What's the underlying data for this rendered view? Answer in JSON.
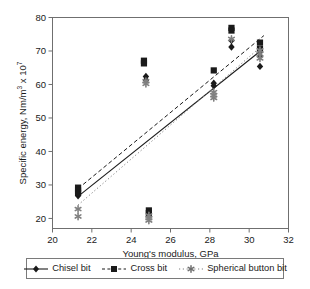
{
  "chart_data": {
    "type": "scatter",
    "title": "",
    "xlabel": "Young's modulus, GPa",
    "ylabel": "Specific energy, Nm/m",
    "ylabel_unit_base": "3",
    "ylabel_multiplier": " x 10",
    "ylabel_exponent": "7",
    "xlim": [
      20,
      32
    ],
    "ylim": [
      17,
      80
    ],
    "xticks": [
      20,
      22,
      24,
      26,
      28,
      30,
      32
    ],
    "yticks": [
      20,
      30,
      40,
      50,
      60,
      70,
      80
    ],
    "grid": false,
    "legend_position": "below-plot",
    "series": [
      {
        "name": "Chisel bit",
        "marker": "diamond",
        "color": "#1a1a1a",
        "line_style": "solid",
        "points": [
          {
            "x": 21.3,
            "y": 26.8
          },
          {
            "x": 21.3,
            "y": 27.4
          },
          {
            "x": 21.3,
            "y": 28.0
          },
          {
            "x": 24.75,
            "y": 62.4
          },
          {
            "x": 24.75,
            "y": 61.3
          },
          {
            "x": 28.2,
            "y": 60.4
          },
          {
            "x": 28.2,
            "y": 59.6
          },
          {
            "x": 29.1,
            "y": 73.1
          },
          {
            "x": 29.1,
            "y": 71.2
          },
          {
            "x": 30.55,
            "y": 69.8
          },
          {
            "x": 30.55,
            "y": 68.5
          },
          {
            "x": 30.55,
            "y": 65.4
          }
        ],
        "trend": {
          "x1": 21.3,
          "y1": 26.6,
          "x2": 30.7,
          "y2": 70.6
        }
      },
      {
        "name": "Cross bit",
        "marker": "square",
        "color": "#1a1a1a",
        "line_style": "dashed",
        "points": [
          {
            "x": 21.3,
            "y": 29.2
          },
          {
            "x": 21.3,
            "y": 28.4
          },
          {
            "x": 21.3,
            "y": 27.6
          },
          {
            "x": 24.65,
            "y": 67.1
          },
          {
            "x": 24.65,
            "y": 66.3
          },
          {
            "x": 24.9,
            "y": 22.4
          },
          {
            "x": 24.9,
            "y": 21.6
          },
          {
            "x": 28.2,
            "y": 64.2
          },
          {
            "x": 29.1,
            "y": 76.9
          },
          {
            "x": 29.1,
            "y": 76.1
          },
          {
            "x": 30.55,
            "y": 72.5
          },
          {
            "x": 30.55,
            "y": 70.6
          }
        ],
        "trend": {
          "x1": 21.3,
          "y1": 28.9,
          "x2": 30.75,
          "y2": 74.6
        }
      },
      {
        "name": "Spherical button bit",
        "marker": "star",
        "color": "#808080",
        "line_style": "dotted",
        "points": [
          {
            "x": 21.3,
            "y": 22.8
          },
          {
            "x": 21.3,
            "y": 20.6
          },
          {
            "x": 24.75,
            "y": 61.0
          },
          {
            "x": 24.75,
            "y": 60.2
          },
          {
            "x": 24.9,
            "y": 20.9
          },
          {
            "x": 24.9,
            "y": 20.1
          },
          {
            "x": 24.9,
            "y": 19.4
          },
          {
            "x": 28.2,
            "y": 57.7
          },
          {
            "x": 28.2,
            "y": 56.8
          },
          {
            "x": 28.2,
            "y": 56.0
          },
          {
            "x": 29.1,
            "y": 73.6
          },
          {
            "x": 30.55,
            "y": 70.2
          },
          {
            "x": 30.55,
            "y": 69.1
          },
          {
            "x": 30.55,
            "y": 67.8
          }
        ],
        "trend": {
          "x1": 21.3,
          "y1": 24.0,
          "x2": 30.7,
          "y2": 71.8
        }
      }
    ]
  },
  "legend": {
    "items": [
      {
        "label": "Chisel bit",
        "marker": "diamond-marker",
        "line": "solid"
      },
      {
        "label": "Cross bit",
        "marker": "square-marker",
        "line": "dashed"
      },
      {
        "label": "Spherical button bit",
        "marker": "star-marker",
        "line": "dotted"
      }
    ]
  }
}
